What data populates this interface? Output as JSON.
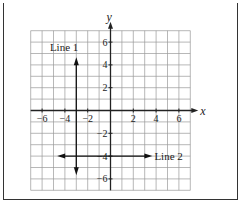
{
  "diagram": {
    "type": "coordinate-plane",
    "axes": {
      "x_label": "x",
      "y_label": "y",
      "range": [
        -7,
        7
      ]
    },
    "x_ticks": [
      "-6",
      "-4",
      "-2",
      "2",
      "4",
      "6"
    ],
    "y_ticks": [
      "6",
      "4",
      "2",
      "-2",
      "-4",
      "-6"
    ],
    "lines": [
      {
        "label": "Line 1",
        "orientation": "vertical",
        "x": -3,
        "from": -5.5,
        "to": 4.5
      },
      {
        "label": "Line 2",
        "orientation": "horizontal",
        "y": -4,
        "from": -4.5,
        "to": 3.5
      }
    ]
  }
}
